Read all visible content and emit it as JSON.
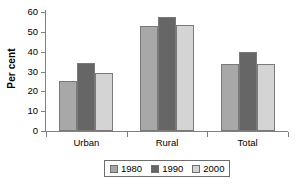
{
  "chart_data": {
    "type": "bar",
    "title": "",
    "subtitle": "",
    "xlabel": "",
    "ylabel": "Per cent",
    "categories": [
      "Urban",
      "Rural",
      "Total"
    ],
    "series": [
      {
        "name": "1980",
        "color": "#a8a8a8",
        "values": [
          25,
          53,
          34
        ]
      },
      {
        "name": "1990",
        "color": "#666666",
        "values": [
          34.5,
          57.5,
          40
        ]
      },
      {
        "name": "2000",
        "color": "#d4d4d4",
        "values": [
          29.5,
          53.5,
          34
        ]
      }
    ],
    "ylim": [
      0,
      60
    ],
    "yticks": [
      0,
      10,
      20,
      30,
      40,
      50,
      60
    ],
    "ytick_labels": [
      "0",
      "10",
      "20",
      "30",
      "40",
      "50",
      "60"
    ],
    "grid": false,
    "legend_position": "bottom",
    "axis_color": "#808080",
    "background_color": "#ffffff"
  },
  "legend": {
    "items": [
      {
        "label": "1980",
        "color": "#a8a8a8"
      },
      {
        "label": "1990",
        "color": "#666666"
      },
      {
        "label": "2000",
        "color": "#d4d4d4"
      }
    ]
  }
}
